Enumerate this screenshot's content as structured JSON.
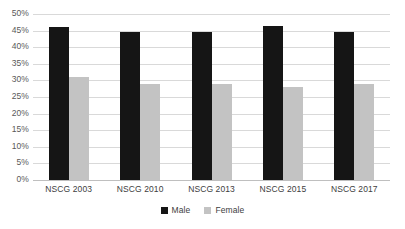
{
  "chart_data": {
    "type": "bar",
    "title": "",
    "xlabel": "",
    "ylabel": "",
    "categories": [
      "NSCG 2003",
      "NSCG 2010",
      "NSCG 2013",
      "NSCG 2015",
      "NSCG 2017"
    ],
    "series": [
      {
        "name": "Male",
        "color": "#151515",
        "values": [
          46.0,
          44.5,
          44.5,
          46.5,
          44.5
        ]
      },
      {
        "name": "Female",
        "color": "#c3c3c3",
        "values": [
          31.0,
          29.0,
          29.0,
          28.0,
          29.0
        ]
      }
    ],
    "ylim": [
      0,
      50
    ],
    "ytick_labels": [
      "50%",
      "45%",
      "40%",
      "35%",
      "30%",
      "25%",
      "20%",
      "15%",
      "10%",
      "5%",
      "0%"
    ],
    "ytick_values": [
      50,
      45,
      40,
      35,
      30,
      25,
      20,
      15,
      10,
      5,
      0
    ],
    "grid": true,
    "legend_position": "bottom",
    "legend": [
      "Male",
      "Female"
    ]
  }
}
